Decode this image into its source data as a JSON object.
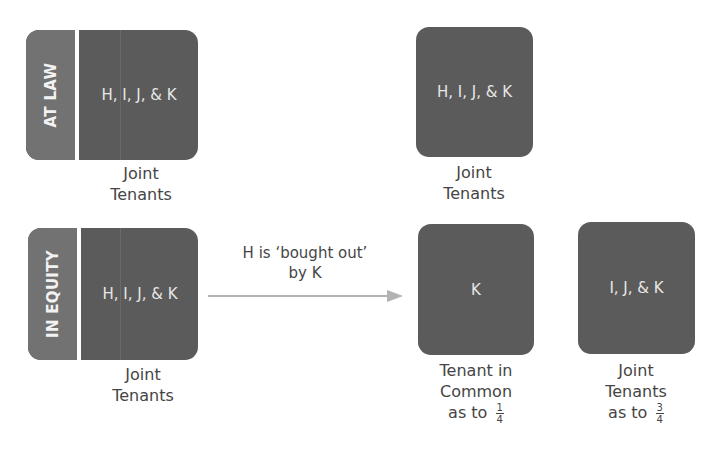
{
  "diagram": {
    "at_law": {
      "side_label": "AT LAW",
      "before": {
        "parties": "H, I, J, & K",
        "caption_line1": "Joint",
        "caption_line2": "Tenants"
      },
      "after": {
        "parties": "H, I, J, & K",
        "caption_line1": "Joint",
        "caption_line2": "Tenants"
      }
    },
    "in_equity": {
      "side_label": "IN EQUITY",
      "before": {
        "parties": "H, I, J, & K",
        "caption_line1": "Joint",
        "caption_line2": "Tenants"
      },
      "transition": {
        "line1": "H is ‘bought out’",
        "line2": "by K"
      },
      "after_left": {
        "parties": "K",
        "caption_line1": "Tenant in",
        "caption_line2": "Common",
        "caption_line3_prefix": "as to",
        "share_numerator": "1",
        "share_denominator": "4"
      },
      "after_right": {
        "parties": "I, J, & K",
        "caption_line1": "Joint",
        "caption_line2": "Tenants",
        "caption_line3_prefix": "as to",
        "share_numerator": "3",
        "share_denominator": "4"
      }
    },
    "colors": {
      "box_fill": "#5b5b5b",
      "label_strip_fill": "#727272",
      "box_text": "#e6e6e6",
      "caption_text": "#454545",
      "arrow": "#b3b3b3"
    }
  }
}
